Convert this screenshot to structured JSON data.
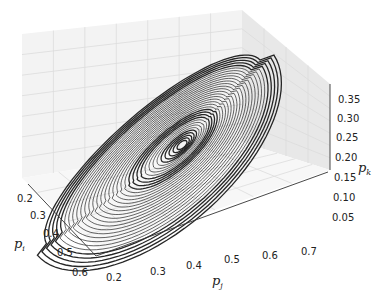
{
  "chart_data": {
    "type": "line3d",
    "title": "",
    "axes": {
      "x": {
        "label": "p_i",
        "label_main": "p",
        "label_sub": "i",
        "ticks": [
          "0.2",
          "0.3",
          "0.4",
          "0.5",
          "0.6"
        ],
        "range": [
          0.15,
          0.62
        ]
      },
      "y": {
        "label": "p_j",
        "label_main": "p",
        "label_sub": "j",
        "ticks": [
          "0.2",
          "0.3",
          "0.4",
          "0.5",
          "0.6",
          "0.7"
        ],
        "range": [
          0.17,
          0.75
        ]
      },
      "z": {
        "label": "p_k",
        "label_main": "p",
        "label_sub": "k",
        "ticks": [
          "0.05",
          "0.10",
          "0.15",
          "0.20",
          "0.25",
          "0.30",
          "0.35"
        ],
        "range": [
          0.02,
          0.38
        ]
      }
    },
    "grid": true,
    "series": [
      {
        "name": "trajectory",
        "color": "#1a1a1a",
        "style": "line"
      }
    ]
  },
  "colors": {
    "pane_back": "#f2f2f2",
    "pane_side": "#e6e6e6",
    "pane_floor": "#f7f7f7",
    "grid": "#d9d9d9",
    "line": "#1a1a1a"
  }
}
